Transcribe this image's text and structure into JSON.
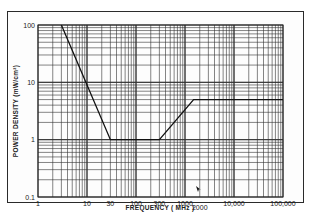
{
  "chart_data": {
    "type": "line",
    "title": "",
    "xlabel": "FREQUENCY (MHz)",
    "ylabel": "POWER DENSITY (mW/cm²)",
    "xscale": "log",
    "yscale": "log",
    "xlim": [
      1,
      100000
    ],
    "ylim": [
      0.1,
      100
    ],
    "grid": true,
    "legend": null,
    "x_tick_labels": [
      "1",
      "10",
      "30",
      "100",
      "300",
      "1000",
      "2000",
      "10,000",
      "100,000"
    ],
    "x_tick_values": [
      1,
      10,
      30,
      100,
      300,
      1000,
      2000,
      10000,
      100000
    ],
    "y_tick_labels": [
      "0.1",
      "1",
      "10",
      "100"
    ],
    "y_tick_values": [
      0.1,
      1,
      10,
      100
    ],
    "series": [
      {
        "name": "Power density limit",
        "x": [
          3,
          30,
          300,
          1500,
          100000
        ],
        "y": [
          100,
          1,
          1,
          5,
          5
        ]
      }
    ],
    "annotations": [
      "marker arrow near 2000 MHz"
    ]
  },
  "labels": {
    "x_axis": "FREQUENCY ( MHz )",
    "y_axis": "POWER DENSITY (mW/cm²)"
  },
  "colors": {
    "grid": "#333333",
    "line": "#111111",
    "frame": "#2a2a2a"
  }
}
